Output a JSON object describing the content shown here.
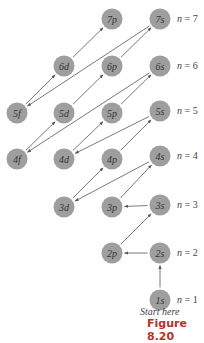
{
  "diagram": {
    "type": "orbital-filling-order",
    "node_color": "#9e9e9e",
    "arrow_color": "#555555",
    "nodes": [
      {
        "id": "7p",
        "label": "7p",
        "x": 112,
        "y": 19
      },
      {
        "id": "7s",
        "label": "7s",
        "x": 160,
        "y": 19
      },
      {
        "id": "6d",
        "label": "6d",
        "x": 64,
        "y": 66
      },
      {
        "id": "6p",
        "label": "6p",
        "x": 112,
        "y": 66
      },
      {
        "id": "6s",
        "label": "6s",
        "x": 160,
        "y": 66
      },
      {
        "id": "5f",
        "label": "5f",
        "x": 17,
        "y": 113
      },
      {
        "id": "5d",
        "label": "5d",
        "x": 64,
        "y": 113
      },
      {
        "id": "5p",
        "label": "5p",
        "x": 112,
        "y": 113
      },
      {
        "id": "5s",
        "label": "5s",
        "x": 160,
        "y": 111
      },
      {
        "id": "4f",
        "label": "4f",
        "x": 17,
        "y": 159
      },
      {
        "id": "4d",
        "label": "4d",
        "x": 64,
        "y": 159
      },
      {
        "id": "4p",
        "label": "4p",
        "x": 112,
        "y": 159
      },
      {
        "id": "4s",
        "label": "4s",
        "x": 160,
        "y": 156
      },
      {
        "id": "3d",
        "label": "3d",
        "x": 64,
        "y": 207
      },
      {
        "id": "3p",
        "label": "3p",
        "x": 112,
        "y": 207
      },
      {
        "id": "3s",
        "label": "3s",
        "x": 160,
        "y": 205
      },
      {
        "id": "2p",
        "label": "2p",
        "x": 112,
        "y": 253
      },
      {
        "id": "2s",
        "label": "2s",
        "x": 160,
        "y": 253
      },
      {
        "id": "1s",
        "label": "1s",
        "x": 160,
        "y": 300
      }
    ],
    "arrows": [
      [
        "1s",
        "2s"
      ],
      [
        "2s",
        "2p"
      ],
      [
        "2p",
        "3s"
      ],
      [
        "3s",
        "3p"
      ],
      [
        "3p",
        "4s"
      ],
      [
        "4s",
        "3d"
      ],
      [
        "3d",
        "4p"
      ],
      [
        "4p",
        "5s"
      ],
      [
        "5s",
        "4d"
      ],
      [
        "4d",
        "5p"
      ],
      [
        "5p",
        "6s"
      ],
      [
        "6s",
        "4f"
      ],
      [
        "4f",
        "5d"
      ],
      [
        "5d",
        "6p"
      ],
      [
        "6p",
        "7s"
      ],
      [
        "7s",
        "5f"
      ],
      [
        "5f",
        "6d"
      ],
      [
        "6d",
        "7p"
      ]
    ],
    "shell_labels": [
      {
        "text": "n = 7",
        "n": "7",
        "x": 177,
        "y": 22
      },
      {
        "text": "n = 6",
        "n": "6",
        "x": 177,
        "y": 69
      },
      {
        "text": "n = 5",
        "n": "5",
        "x": 177,
        "y": 114
      },
      {
        "text": "n = 4",
        "n": "4",
        "x": 177,
        "y": 159
      },
      {
        "text": "n = 3",
        "n": "3",
        "x": 177,
        "y": 208
      },
      {
        "text": "n = 2",
        "n": "2",
        "x": 177,
        "y": 256
      },
      {
        "text": "n = 1",
        "n": "1",
        "x": 177,
        "y": 303
      }
    ]
  },
  "start_label": "Start here",
  "caption": "Figure 8.20"
}
